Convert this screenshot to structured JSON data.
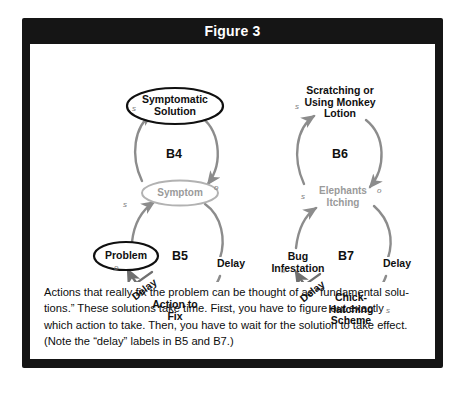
{
  "figure": {
    "title": "Figure 3",
    "title_band_color": "#151515",
    "frame_color": "#151515",
    "panel_color": "#ffffff",
    "arc_color": "#8c8c8c",
    "gray_text_color": "#9a9a9a",
    "black_text_color": "#101010"
  },
  "diagram": {
    "left": {
      "loops": [
        {
          "id": "B4",
          "label": "B4"
        },
        {
          "id": "B5",
          "label": "B5"
        }
      ],
      "nodes": [
        {
          "id": "symptomatic-solution",
          "label": "Symptomatic\nSolution",
          "shape": "ellipse",
          "style": "black"
        },
        {
          "id": "symptom",
          "label": "Symptom",
          "shape": "ellipse",
          "style": "gray"
        },
        {
          "id": "problem",
          "label": "Problem",
          "shape": "ellipse",
          "style": "black"
        },
        {
          "id": "action-to-fix",
          "label": "Action to\nFix",
          "shape": "ellipse",
          "style": "black"
        }
      ],
      "polarities": [
        {
          "id": "b4-s-left",
          "label": "s"
        },
        {
          "id": "b4-o-right",
          "label": "o"
        },
        {
          "id": "b5-s-left",
          "label": "s"
        },
        {
          "id": "b5-o-left",
          "label": "o"
        },
        {
          "id": "b5-s-right",
          "label": "s"
        }
      ],
      "delays": [
        {
          "id": "b5-delay-right",
          "label": "Delay"
        },
        {
          "id": "b5-delay-diagonal",
          "label": "Delay"
        }
      ]
    },
    "right": {
      "loops": [
        {
          "id": "B6",
          "label": "B6"
        },
        {
          "id": "B7",
          "label": "B7"
        }
      ],
      "nodes": [
        {
          "id": "scratching-monkey-lotion",
          "label": "Scratching or\nUsing Monkey\nLotion",
          "shape": "none",
          "style": "black"
        },
        {
          "id": "elephants-itching",
          "label": "Elephants\nItching",
          "shape": "none",
          "style": "gray"
        },
        {
          "id": "bug-infestation",
          "label": "Bug\nInfestation",
          "shape": "none",
          "style": "black"
        },
        {
          "id": "chick-hatching-scheme",
          "label": "Chick-\nHatching\nScheme",
          "shape": "none",
          "style": "black"
        }
      ],
      "polarities": [
        {
          "id": "b6-s-left",
          "label": "s"
        },
        {
          "id": "b6-o-right",
          "label": "o"
        },
        {
          "id": "b7-s-left",
          "label": "s"
        },
        {
          "id": "b7-o-left",
          "label": "o"
        },
        {
          "id": "b7-s-right",
          "label": "s"
        }
      ],
      "delays": [
        {
          "id": "b7-delay-right",
          "label": "Delay"
        },
        {
          "id": "b7-delay-diagonal",
          "label": "Delay"
        }
      ]
    }
  },
  "caption": {
    "line1": "Actions that really fix the problem can be thought of as “fundamental solu-",
    "line2": "tions.” These solutions take time. First, you have to figure out exactly",
    "line3": "which action to take. Then, you have to wait for the solution to take effect.",
    "line4": "(Note the “delay” labels in B5 and B7.)"
  }
}
